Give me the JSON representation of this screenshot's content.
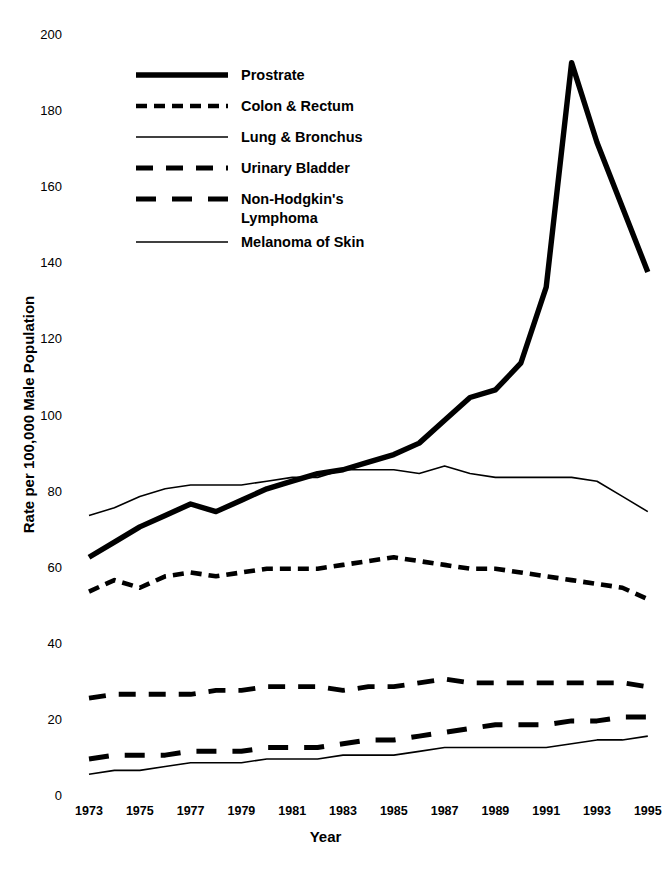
{
  "chart_data": {
    "type": "line",
    "title": "",
    "xlabel": "Year",
    "ylabel": "Rate per 100,000 Male Population",
    "xlim": [
      1973,
      1995
    ],
    "ylim": [
      0,
      200
    ],
    "ytick_labels": [
      "200",
      "180",
      "160",
      "140",
      "120",
      "100",
      "80",
      "60",
      "40",
      "20",
      "0"
    ],
    "ytick_values": [
      200,
      180,
      160,
      140,
      120,
      100,
      80,
      60,
      40,
      20,
      0
    ],
    "xtick_labels": [
      "1973",
      "1975",
      "1977",
      "1979",
      "1981",
      "1983",
      "1985",
      "1987",
      "1989",
      "1991",
      "1993",
      "1995"
    ],
    "xtick_values": [
      1973,
      1975,
      1977,
      1979,
      1981,
      1983,
      1985,
      1987,
      1989,
      1991,
      1993,
      1995
    ],
    "x": [
      1973,
      1974,
      1975,
      1976,
      1977,
      1978,
      1979,
      1980,
      1981,
      1982,
      1983,
      1984,
      1985,
      1986,
      1987,
      1988,
      1989,
      1990,
      1991,
      1992,
      1993,
      1994,
      1995
    ],
    "grid": false,
    "legend_position": "upper-left",
    "series": [
      {
        "name": "Prostrate",
        "style": "solid-thick",
        "values": [
          63,
          67,
          71,
          74,
          77,
          75,
          78,
          81,
          83,
          85,
          86,
          88,
          90,
          93,
          99,
          105,
          107,
          114,
          134,
          193,
          172,
          155,
          138
        ]
      },
      {
        "name": "Colon & Rectum",
        "style": "dashed-fine",
        "values": [
          54,
          57,
          55,
          58,
          59,
          58,
          59,
          60,
          60,
          60,
          61,
          62,
          63,
          62,
          61,
          60,
          60,
          59,
          58,
          57,
          56,
          55,
          52
        ]
      },
      {
        "name": "Lung & Bronchus",
        "style": "solid-thin",
        "values": [
          74,
          76,
          79,
          81,
          82,
          82,
          82,
          83,
          84,
          84,
          86,
          86,
          86,
          85,
          87,
          85,
          84,
          84,
          84,
          84,
          83,
          79,
          75
        ]
      },
      {
        "name": "Urinary Bladder",
        "style": "dashed-medium",
        "values": [
          26,
          27,
          27,
          27,
          27,
          28,
          28,
          29,
          29,
          29,
          28,
          29,
          29,
          30,
          31,
          30,
          30,
          30,
          30,
          30,
          30,
          30,
          29
        ]
      },
      {
        "name": "Non-Hodgkin's Lymphoma",
        "style": "dashed-wide",
        "values": [
          10,
          11,
          11,
          11,
          12,
          12,
          12,
          13,
          13,
          13,
          14,
          15,
          15,
          16,
          17,
          18,
          19,
          19,
          19,
          20,
          20,
          21,
          21
        ]
      },
      {
        "name": "Melanoma of Skin",
        "style": "solid-thin",
        "values": [
          6,
          7,
          7,
          8,
          9,
          9,
          9,
          10,
          10,
          10,
          11,
          11,
          11,
          12,
          13,
          13,
          13,
          13,
          13,
          14,
          15,
          15,
          16
        ]
      }
    ]
  },
  "legend": {
    "items": [
      {
        "label": "Prostrate",
        "swatch": "solid-thick"
      },
      {
        "label": "Colon & Rectum",
        "swatch": "dashed-fine"
      },
      {
        "label": "Lung & Bronchus",
        "swatch": "solid-thin"
      },
      {
        "label": "Urinary Bladder",
        "swatch": "dashed-medium"
      },
      {
        "label": "Non-Hodgkin's\nLymphoma",
        "swatch": "dashed-wide"
      },
      {
        "label": "Melanoma of Skin",
        "swatch": "solid-thin"
      }
    ]
  },
  "colors": {
    "line": "#000000",
    "background": "#ffffff",
    "text": "#000000"
  }
}
